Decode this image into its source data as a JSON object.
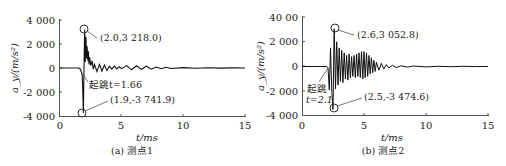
{
  "chart_data": [
    {
      "type": "line",
      "panel": "a",
      "caption": "(a) 测点1",
      "xlabel": "t/ms",
      "ylabel": "a_y/(m/s²)",
      "xlim": [
        0,
        15
      ],
      "ylim": [
        -4000,
        4000
      ],
      "xticks": [
        "0",
        "5",
        "10",
        "15"
      ],
      "yticks": [
        "4 000",
        "2 000",
        "0",
        "-2 000",
        "-4 000"
      ],
      "grid": false,
      "onset": {
        "t": 1.66,
        "label": "起跳t=1.66"
      },
      "annotations": [
        {
          "x": 2.0,
          "y": 3218.0,
          "label": "(2.0,3 218.0)"
        },
        {
          "x": 1.9,
          "y": -3741.9,
          "label": "(1.9,-3 741.9)"
        }
      ],
      "series": [
        {
          "name": "测点1",
          "x": [
            0,
            1.5,
            1.66,
            1.8,
            1.85,
            1.9,
            1.95,
            2.0,
            2.05,
            2.1,
            2.15,
            2.2,
            2.25,
            2.3,
            2.35,
            2.4,
            2.5,
            2.6,
            2.7,
            2.8,
            3.0,
            3.2,
            3.4,
            3.6,
            3.8,
            4.0,
            4.2,
            4.4,
            4.6,
            4.8,
            5.0,
            5.4,
            5.8,
            6.2,
            6.6,
            7.0,
            7.4,
            7.8,
            8.2,
            8.6,
            9.0,
            10,
            11,
            12,
            13,
            14,
            15
          ],
          "y": [
            0,
            0,
            -100,
            -600,
            -2000,
            -3741.9,
            0,
            3218.0,
            500,
            2600,
            800,
            1800,
            600,
            1400,
            300,
            900,
            200,
            600,
            -100,
            300,
            -300,
            300,
            -250,
            250,
            -200,
            150,
            -100,
            150,
            -80,
            100,
            -60,
            200,
            -150,
            180,
            -120,
            150,
            -100,
            80,
            -60,
            60,
            -40,
            30,
            -20,
            20,
            -10,
            10,
            0
          ]
        }
      ]
    },
    {
      "type": "line",
      "panel": "b",
      "caption": "(b) 测点2",
      "xlabel": "t/ms",
      "ylabel": "a_y/(m/s²)",
      "xlim": [
        0,
        15
      ],
      "ylim": [
        -4000,
        4000
      ],
      "xticks": [
        "0",
        "5",
        "10",
        "15"
      ],
      "yticks": [
        "40 00",
        "2 000",
        "0",
        "-2 000",
        "-4 000"
      ],
      "grid": false,
      "onset": {
        "t": 2.1,
        "label_line1": "起跳",
        "label_line2": "t=2.1"
      },
      "annotations": [
        {
          "x": 2.6,
          "y": 3052.8,
          "label": "(2.6,3 052.8)"
        },
        {
          "x": 2.5,
          "y": -3474.6,
          "label": "(2.5,-3 474.6)"
        }
      ],
      "series": [
        {
          "name": "测点2",
          "x": [
            0,
            2.0,
            2.1,
            2.2,
            2.3,
            2.4,
            2.5,
            2.55,
            2.6,
            2.7,
            2.8,
            2.9,
            3.0,
            3.1,
            3.2,
            3.3,
            3.4,
            3.5,
            3.6,
            3.7,
            3.8,
            3.9,
            4.0,
            4.1,
            4.2,
            4.3,
            4.4,
            4.5,
            4.6,
            4.7,
            4.8,
            4.9,
            5.0,
            5.1,
            5.2,
            5.3,
            5.4,
            5.5,
            5.6,
            5.7,
            5.8,
            5.9,
            6.0,
            6.2,
            6.4,
            6.6,
            6.8,
            7.0,
            7.3,
            7.6,
            8.0,
            8.5,
            9,
            10,
            11,
            12,
            13,
            14,
            15
          ],
          "y": [
            0,
            0,
            -100,
            -1900,
            1500,
            -2000,
            -3474.6,
            0,
            3052.8,
            -1800,
            2000,
            -1500,
            1500,
            -1200,
            1300,
            -1300,
            1100,
            -1000,
            900,
            -1100,
            1000,
            -900,
            800,
            -800,
            900,
            -900,
            1000,
            -800,
            1100,
            -900,
            1200,
            -1000,
            1200,
            -900,
            1100,
            -800,
            900,
            -600,
            700,
            -500,
            500,
            -400,
            350,
            -300,
            250,
            -200,
            150,
            -120,
            100,
            -80,
            60,
            -50,
            40,
            -30,
            20,
            -20,
            15,
            -10,
            0
          ]
        }
      ]
    }
  ]
}
